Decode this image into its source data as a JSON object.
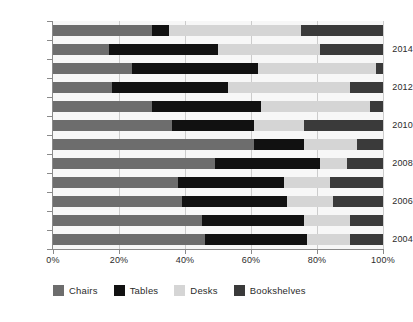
{
  "chart_data": {
    "type": "bar",
    "orientation": "horizontal",
    "stacked": true,
    "normalized_percent": true,
    "title": "",
    "subtitle": "",
    "xlabel": "",
    "ylabel": "",
    "xlim": [
      0,
      100
    ],
    "xticks": [
      0,
      20,
      40,
      60,
      80,
      100
    ],
    "xtick_labels": [
      "0%",
      "20%",
      "40%",
      "60%",
      "80%",
      "100%"
    ],
    "grid": "vertical",
    "legend_position": "bottom-left",
    "categories": [
      "2015",
      "2014",
      "2013",
      "2012",
      "2011",
      "2010",
      "2009",
      "2008",
      "2007",
      "2006",
      "2005",
      "2004"
    ],
    "visible_ytick_labels": [
      "2014",
      "2012",
      "2010",
      "2008",
      "2006",
      "2004"
    ],
    "series": [
      {
        "name": "Chairs",
        "color": "#6d6d6d",
        "values": [
          30,
          17,
          24,
          18,
          30,
          36,
          61,
          49,
          38,
          39,
          45,
          46
        ]
      },
      {
        "name": "Tables",
        "color": "#111111",
        "values": [
          5,
          33,
          38,
          35,
          33,
          25,
          15,
          32,
          32,
          32,
          31,
          31
        ]
      },
      {
        "name": "Desks",
        "color": "#d5d5d5",
        "values": [
          40,
          31,
          36,
          37,
          33,
          15,
          16,
          8,
          14,
          14,
          14,
          13
        ]
      },
      {
        "name": "Bookshelves",
        "color": "#3a3a3a",
        "values": [
          25,
          19,
          2,
          10,
          4,
          24,
          8,
          11,
          16,
          15,
          10,
          10
        ]
      }
    ]
  },
  "legend": {
    "items": [
      {
        "label": "Chairs",
        "color": "#6d6d6d"
      },
      {
        "label": "Tables",
        "color": "#111111"
      },
      {
        "label": "Desks",
        "color": "#d5d5d5"
      },
      {
        "label": "Bookshelves",
        "color": "#3a3a3a"
      }
    ]
  }
}
